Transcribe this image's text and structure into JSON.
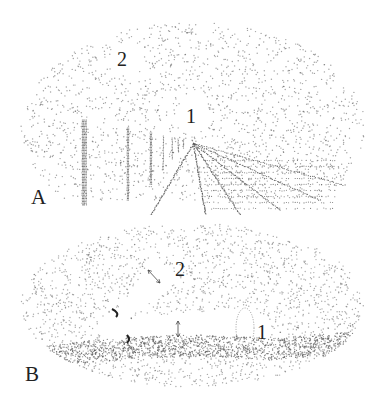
{
  "figure": {
    "panels": [
      {
        "id": "A",
        "panel_label": "A",
        "markers": [
          {
            "label": "1",
            "description": "vanishing point / focus of expansion at horizon"
          },
          {
            "label": "2",
            "description": "upper field region"
          }
        ],
        "scene": "stippled visual field with horizon, vertical posts and converging ground lines"
      },
      {
        "id": "B",
        "panel_label": "B",
        "markers": [
          {
            "label": "1",
            "description": "end of horizontal cone / beam"
          },
          {
            "label": "2",
            "description": "end of oblique cone / beam"
          }
        ],
        "scene": "stippled visual field with two cone-shaped beams from eye, double arrows indicating width, dense ground band"
      }
    ],
    "colors": {
      "ink": "#222222",
      "stipple": "#555555",
      "background": "#ffffff"
    }
  }
}
